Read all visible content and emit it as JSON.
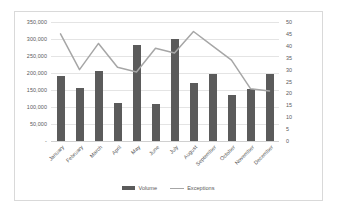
{
  "chart_data": {
    "type": "bar",
    "title": "",
    "subtitle": "",
    "xlabel": "",
    "ylabel": "",
    "grid": true,
    "legend_position": "bottom",
    "categories": [
      "January",
      "February",
      "March",
      "April",
      "May",
      "June",
      "July",
      "August",
      "September",
      "October",
      "November",
      "December"
    ],
    "series": [
      {
        "name": "Volume",
        "type": "bar",
        "axis": "left",
        "color": "#5b5b5b",
        "values": [
          190000,
          155000,
          207000,
          112000,
          283000,
          108000,
          300000,
          172000,
          196000,
          135000,
          154000,
          197000
        ]
      },
      {
        "name": "Exceptions",
        "type": "line",
        "axis": "right",
        "color": "#a6a6a6",
        "values": [
          45,
          30,
          41,
          31,
          29,
          39,
          37,
          46,
          40,
          34,
          22,
          21
        ]
      }
    ],
    "axes": {
      "left": {
        "min": 0,
        "max": 350000,
        "step": 50000,
        "tick_labels": [
          "350,000",
          "300,000",
          "250,000",
          "200,000",
          "150,000",
          "100,000",
          "50,000",
          "-"
        ],
        "tick_values": [
          350000,
          300000,
          250000,
          200000,
          150000,
          100000,
          50000,
          0
        ]
      },
      "right": {
        "min": 0,
        "max": 50,
        "step": 5,
        "tick_labels": [
          "50",
          "45",
          "40",
          "35",
          "30",
          "25",
          "20",
          "15",
          "10",
          "5",
          "0"
        ],
        "tick_values": [
          50,
          45,
          40,
          35,
          30,
          25,
          20,
          15,
          10,
          5,
          0
        ]
      }
    },
    "legend": [
      {
        "label": "Volume",
        "marker": "bar",
        "color": "#5b5b5b"
      },
      {
        "label": "Exceptions",
        "marker": "line",
        "color": "#a6a6a6"
      }
    ]
  },
  "style": {
    "plot_background": "#ffffff",
    "gridline_color": "#e4e4e4",
    "border_color": "#d9d9d9",
    "text_color": "#595959"
  }
}
